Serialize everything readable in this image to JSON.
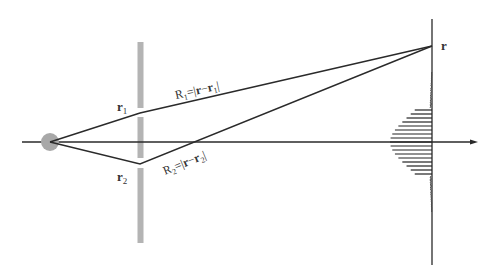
{
  "diagram": {
    "colors": {
      "background": "#ffffff",
      "line": "#2a2a2a",
      "barrier": "#b4b4b4",
      "source": "#a8a8a8",
      "text": "#333333"
    },
    "source": {
      "cx": 50,
      "cy": 142,
      "r": 9
    },
    "axis": {
      "x1": 22,
      "x2": 478,
      "y": 142
    },
    "barrier": {
      "x": 137.5,
      "width": 6,
      "top": 42,
      "bottom": 243,
      "gap1": [
        108,
        116
      ],
      "gap2": [
        158,
        168
      ]
    },
    "screen": {
      "x": 432,
      "top": 19,
      "bottom": 265
    },
    "slits": {
      "r1": {
        "x": 140,
        "y": 113,
        "label_base": "r",
        "label_sub": "1"
      },
      "r2": {
        "x": 140,
        "y": 164,
        "label_base": "r",
        "label_sub": "2"
      }
    },
    "observation_point": {
      "x": 432,
      "y": 46,
      "label": "r"
    },
    "labels": {
      "R1": {
        "base": "R",
        "sub": "1",
        "expr_pre": "=|",
        "expr_bold": "r",
        "expr_mid": "−",
        "expr_bold2": "r",
        "expr_sub": "1",
        "expr_post": "|"
      },
      "R2": {
        "base": "R",
        "sub": "2",
        "expr_pre": "=|",
        "expr_bold": "r",
        "expr_mid": "−",
        "expr_bold2": "r",
        "expr_sub": "2",
        "expr_post": "|"
      }
    },
    "fringe_pattern": {
      "type": "gaussian-envelope-interference",
      "center_y": 142,
      "peak_extent_px": 42,
      "sigma_px": 24,
      "fringe_spacing_px": 4,
      "tail_extent_y": [
        72,
        212
      ]
    }
  }
}
